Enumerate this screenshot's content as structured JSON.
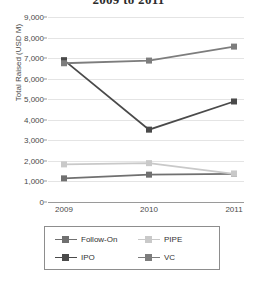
{
  "chart_data": {
    "type": "line",
    "title": "2009 to 2011",
    "xlabel": "",
    "ylabel": "Total Raised (USD M)",
    "categories": [
      "2009",
      "2010",
      "2011"
    ],
    "ylim": [
      0,
      9000
    ],
    "yticks": [
      "0",
      "1,000",
      "2,000",
      "3,000",
      "4,000",
      "5,000",
      "6,000",
      "7,000",
      "8,000",
      "9,000"
    ],
    "ytick_values": [
      0,
      1000,
      2000,
      3000,
      4000,
      5000,
      6000,
      7000,
      8000,
      9000
    ],
    "grid": true,
    "legend_position": "bottom",
    "series": [
      {
        "name": "Follow-On",
        "values": [
          1150,
          1330,
          1370
        ],
        "color": "#707070"
      },
      {
        "name": "PIPE",
        "values": [
          1830,
          1890,
          1370
        ],
        "color": "#c9c9c9"
      },
      {
        "name": "IPO",
        "values": [
          6900,
          3520,
          4890
        ],
        "color": "#4a4a4a"
      },
      {
        "name": "VC",
        "values": [
          6750,
          6880,
          7560
        ],
        "color": "#7d7d7d"
      }
    ]
  },
  "legend": {
    "entries": [
      {
        "label": "Follow-On"
      },
      {
        "label": "PIPE"
      },
      {
        "label": "IPO"
      },
      {
        "label": "VC"
      }
    ]
  }
}
